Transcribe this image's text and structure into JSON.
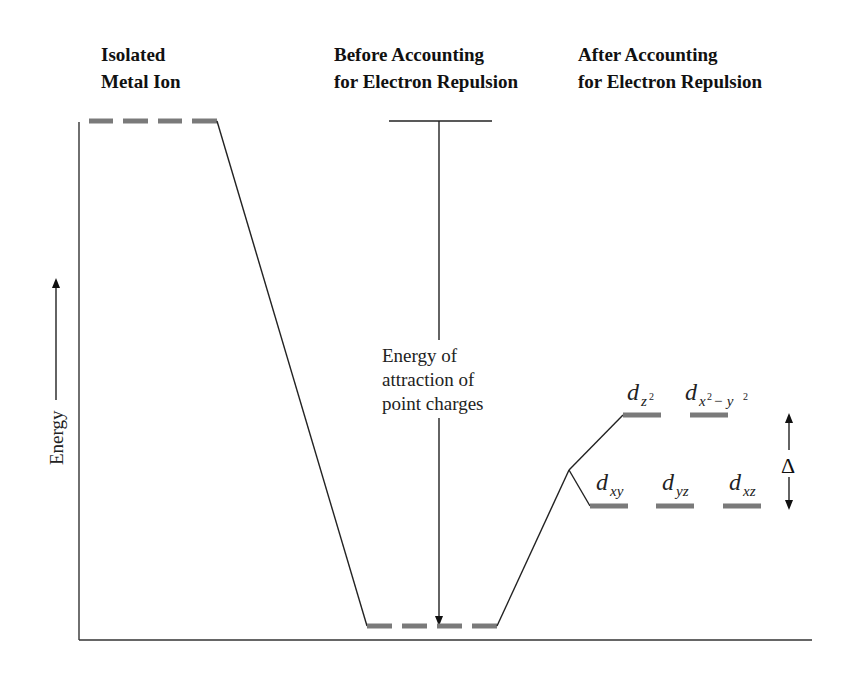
{
  "headers": {
    "isolated": [
      "Isolated",
      "Metal Ion"
    ],
    "before": [
      "Before Accounting",
      "for Electron Repulsion"
    ],
    "after": [
      "After Accounting",
      "for Electron Repulsion"
    ]
  },
  "axis": {
    "y_label": "Energy"
  },
  "annotation": {
    "lines": [
      "Energy of",
      "attraction of",
      "point charges"
    ]
  },
  "orbitals": {
    "eg": [
      {
        "base": "d",
        "sub": "z",
        "sup": "2",
        "name": "dz2"
      },
      {
        "base": "d",
        "sub": "x",
        "sup": "2",
        "sub2": " − y",
        "sup2": "2",
        "name": "dx2-y2"
      }
    ],
    "t2g": [
      {
        "base": "d",
        "sub": "xy",
        "name": "dxy"
      },
      {
        "base": "d",
        "sub": "yz",
        "name": "dyz"
      },
      {
        "base": "d",
        "sub": "xz",
        "name": "dxz"
      }
    ]
  },
  "splitting": {
    "symbol": "Δ"
  },
  "colors": {
    "level": "#7a7a7a",
    "line": "#222222"
  }
}
